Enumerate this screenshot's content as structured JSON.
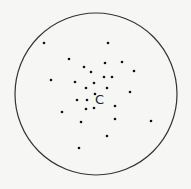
{
  "diagram": {
    "circle": {
      "cx": 96,
      "cy": 94,
      "r": 81,
      "stroke": "#333333"
    },
    "center_label": {
      "text": "C",
      "x": 95,
      "y": 104
    },
    "dot_color": "#111111",
    "dots": [
      [
        44,
        43
      ],
      [
        108,
        43
      ],
      [
        69,
        59
      ],
      [
        84,
        67
      ],
      [
        105,
        63
      ],
      [
        122,
        62
      ],
      [
        134,
        71
      ],
      [
        51,
        80
      ],
      [
        75,
        82
      ],
      [
        91,
        72
      ],
      [
        104,
        77
      ],
      [
        112,
        77
      ],
      [
        94,
        83
      ],
      [
        86,
        88
      ],
      [
        107,
        88
      ],
      [
        130,
        92
      ],
      [
        95,
        94
      ],
      [
        77,
        100
      ],
      [
        87,
        100
      ],
      [
        115,
        106
      ],
      [
        62,
        112
      ],
      [
        86,
        109
      ],
      [
        94,
        108
      ],
      [
        115,
        119
      ],
      [
        81,
        122
      ],
      [
        151,
        121
      ],
      [
        107,
        136
      ],
      [
        79,
        148
      ]
    ]
  }
}
